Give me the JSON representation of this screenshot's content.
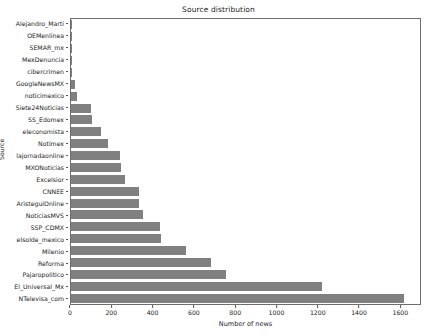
{
  "chart_data": {
    "type": "bar",
    "orientation": "horizontal",
    "title": "Source distribution",
    "xlabel": "Number of news",
    "ylabel": "Source",
    "xlim": [
      0,
      1700
    ],
    "ylim": null,
    "grid": false,
    "legend": null,
    "bar_color": "#808080",
    "xticks": [
      0,
      200,
      400,
      600,
      800,
      1000,
      1200,
      1400,
      1600
    ],
    "categories": [
      "Alejandro_Marti",
      "OEMenlinea",
      "SEMAR_mx",
      "MexDenuncia",
      "cibercrimen",
      "GoogleNewsMX",
      "noticimexico",
      "Siete24Noticias",
      "SS_Edomex",
      "eleconomista",
      "Notimex",
      "lajornadaonline",
      "MXONoticias",
      "Excelsior",
      "CNNEE",
      "AristeguiOnline",
      "NoticiasMVS",
      "SSP_CDMX",
      "elsolde_mexico",
      "Milenio",
      "Reforma",
      "Pajaropolitico",
      "El_Universal_Mx",
      "NTelevisa_com"
    ],
    "values": [
      2,
      3,
      3,
      4,
      6,
      17,
      29,
      97,
      101,
      145,
      177,
      238,
      244,
      260,
      328,
      327,
      350,
      429,
      434,
      559,
      679,
      752,
      1214,
      1614
    ]
  }
}
